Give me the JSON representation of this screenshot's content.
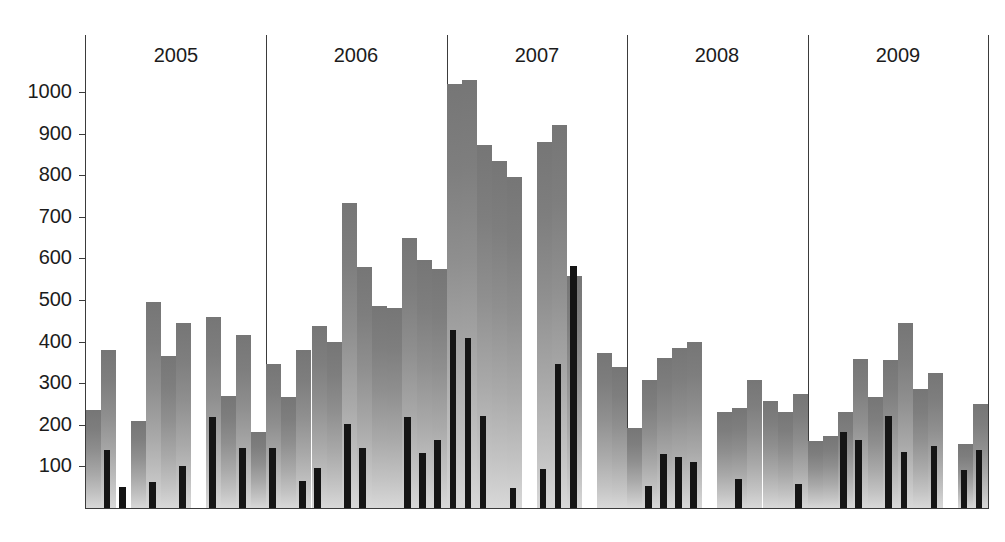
{
  "chart_data": {
    "type": "bar",
    "title": "",
    "subtitle": "",
    "xlabel": "",
    "ylabel": "",
    "ylim": [
      0,
      1060
    ],
    "grid": false,
    "legend_position": "none",
    "orientation": "vertical",
    "bar_style": "overlaid-grouped",
    "y_ticks": [
      100,
      200,
      300,
      400,
      500,
      600,
      700,
      800,
      900,
      1000
    ],
    "y_tick_labels": [
      "100",
      "200",
      "300",
      "400",
      "500",
      "600",
      "700",
      "800",
      "900",
      "1000"
    ],
    "year_groups": [
      "2005",
      "2006",
      "2007",
      "2008",
      "2009"
    ],
    "months_per_year": 12,
    "categories": [
      "2005-01",
      "2005-02",
      "2005-03",
      "2005-04",
      "2005-05",
      "2005-06",
      "2005-07",
      "2005-08",
      "2005-09",
      "2005-10",
      "2005-11",
      "2005-12",
      "2006-01",
      "2006-02",
      "2006-03",
      "2006-04",
      "2006-05",
      "2006-06",
      "2006-07",
      "2006-08",
      "2006-09",
      "2006-10",
      "2006-11",
      "2006-12",
      "2007-01",
      "2007-02",
      "2007-03",
      "2007-04",
      "2007-05",
      "2007-06",
      "2007-07",
      "2007-08",
      "2007-09",
      "2007-10",
      "2007-11",
      "2007-12",
      "2008-01",
      "2008-02",
      "2008-03",
      "2008-04",
      "2008-05",
      "2008-06",
      "2008-07",
      "2008-08",
      "2008-09",
      "2008-10",
      "2008-11",
      "2008-12",
      "2009-01",
      "2009-02",
      "2009-03",
      "2009-04",
      "2009-05",
      "2009-06",
      "2009-07",
      "2009-08",
      "2009-09",
      "2009-10",
      "2009-11",
      "2009-12"
    ],
    "series": [
      {
        "name": "total",
        "color": "#8f8f8f",
        "fill": "vertical-gradient-light-bottom-dark-top",
        "width_fraction": 1.0,
        "values": [
          235,
          380,
          0,
          210,
          495,
          365,
          445,
          0,
          458,
          270,
          415,
          183,
          345,
          268,
          380,
          438,
          400,
          733,
          580,
          485,
          480,
          650,
          597,
          575,
          1020,
          1030,
          872,
          835,
          795,
          0,
          880,
          920,
          558,
          0,
          372,
          338,
          192,
          308,
          360,
          385,
          398,
          0,
          230,
          240,
          307,
          258,
          230,
          275,
          160,
          172,
          232,
          358,
          268,
          356,
          445,
          287,
          325,
          0,
          155,
          250
        ]
      },
      {
        "name": "subset",
        "color": "#151515",
        "fill": "solid",
        "width_fraction": 0.45,
        "values": [
          0,
          140,
          50,
          0,
          62,
          0,
          102,
          0,
          218,
          0,
          145,
          0,
          145,
          0,
          65,
          95,
          0,
          203,
          145,
          0,
          0,
          218,
          132,
          163,
          427,
          408,
          222,
          0,
          48,
          0,
          93,
          345,
          582,
          0,
          0,
          0,
          0,
          52,
          131,
          122,
          110,
          0,
          0,
          70,
          0,
          0,
          0,
          58,
          0,
          0,
          182,
          163,
          0,
          220,
          135,
          0,
          150,
          0,
          92,
          140
        ]
      }
    ]
  },
  "axis": {
    "y_label_color": "#1c1c1c",
    "axis_color": "#3b3b3b",
    "baseline_value": 0
  }
}
